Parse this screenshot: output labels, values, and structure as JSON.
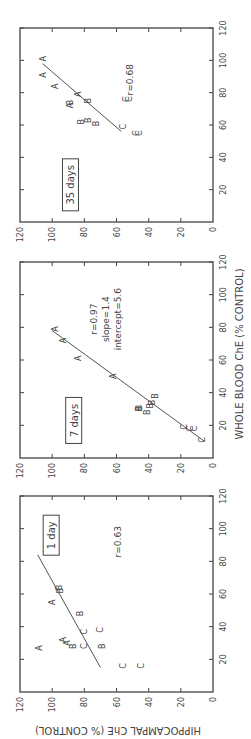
{
  "figure": {
    "ylabel": "HIPPOCAMPAL ChE (% CONTROL)",
    "xlabel": "WHOLE BLOOD ChE (% CONTROL)",
    "rotation_deg": -90
  },
  "chart_data": [
    {
      "type": "scatter",
      "title": "1 day",
      "xlabel": "WHOLE BLOOD ChE (% CONTROL)",
      "ylabel": "HIPPOCAMPAL ChE (% CONTROL)",
      "xlim": [
        0,
        120
      ],
      "ylim": [
        0,
        120
      ],
      "xticks": [
        20,
        40,
        60,
        80,
        100,
        120
      ],
      "yticks": [
        0,
        20,
        40,
        60,
        80,
        100,
        120
      ],
      "annotations": [
        "r=0.63"
      ],
      "points": [
        {
          "label": "A",
          "x": 27,
          "y": 108
        },
        {
          "label": "A",
          "x": 30,
          "y": 91
        },
        {
          "label": "A",
          "x": 32,
          "y": 93
        },
        {
          "label": "B",
          "x": 28,
          "y": 87
        },
        {
          "label": "C",
          "x": 28,
          "y": 80
        },
        {
          "label": "C",
          "x": 37,
          "y": 80
        },
        {
          "label": "B",
          "x": 28,
          "y": 69
        },
        {
          "label": "C",
          "x": 38,
          "y": 70
        },
        {
          "label": "B",
          "x": 48,
          "y": 83
        },
        {
          "label": "A",
          "x": 55,
          "y": 100
        },
        {
          "label": "B",
          "x": 62,
          "y": 95
        },
        {
          "label": "B",
          "x": 64,
          "y": 96
        },
        {
          "label": "A",
          "x": 86,
          "y": 103
        },
        {
          "label": "C",
          "x": 16,
          "y": 56
        },
        {
          "label": "C",
          "x": 16,
          "y": 45
        }
      ],
      "fit_line": {
        "x": [
          15,
          84
        ],
        "y": [
          70,
          109
        ]
      }
    },
    {
      "type": "scatter",
      "title": "7 days",
      "xlabel": "WHOLE BLOOD ChE (% CONTROL)",
      "ylabel": "HIPPOCAMPAL ChE (% CONTROL)",
      "xlim": [
        0,
        120
      ],
      "ylim": [
        0,
        120
      ],
      "xticks": [
        20,
        40,
        60,
        80,
        100,
        120
      ],
      "yticks": [
        0,
        20,
        40,
        60,
        80,
        100,
        120
      ],
      "annotations": [
        "r=0.97",
        "slope=1.4",
        "intercept=5.6"
      ],
      "points": [
        {
          "label": "A",
          "x": 79,
          "y": 98
        },
        {
          "label": "A",
          "x": 72,
          "y": 93
        },
        {
          "label": "A",
          "x": 61,
          "y": 84
        },
        {
          "label": "A",
          "x": 50,
          "y": 62
        },
        {
          "label": "B",
          "x": 30,
          "y": 46
        },
        {
          "label": "B",
          "x": 31,
          "y": 46
        },
        {
          "label": "B",
          "x": 28,
          "y": 41
        },
        {
          "label": "B",
          "x": 32,
          "y": 39
        },
        {
          "label": "B",
          "x": 34,
          "y": 38
        },
        {
          "label": "B",
          "x": 38,
          "y": 36
        },
        {
          "label": "C",
          "x": 19,
          "y": 18
        },
        {
          "label": "C",
          "x": 18,
          "y": 14
        },
        {
          "label": "C",
          "x": 18,
          "y": 12
        },
        {
          "label": "C",
          "x": 11,
          "y": 7
        }
      ],
      "fit_line": {
        "x": [
          10,
          78
        ],
        "y": [
          5,
          100
        ]
      }
    },
    {
      "type": "scatter",
      "title": "35 days",
      "xlabel": "WHOLE BLOOD ChE (% CONTROL)",
      "ylabel": "HIPPOCAMPAL ChE (% CONTROL)",
      "xlim": [
        0,
        120
      ],
      "ylim": [
        0,
        120
      ],
      "xticks": [
        20,
        40,
        60,
        80,
        100,
        120
      ],
      "yticks": [
        0,
        20,
        40,
        60,
        80,
        100,
        120
      ],
      "annotations": [
        "r=0.68"
      ],
      "points": [
        {
          "label": "A",
          "x": 101,
          "y": 106
        },
        {
          "label": "A",
          "x": 91,
          "y": 106
        },
        {
          "label": "A",
          "x": 84,
          "y": 98
        },
        {
          "label": "A",
          "x": 79,
          "y": 84
        },
        {
          "label": "A",
          "x": 72,
          "y": 89
        },
        {
          "label": "B",
          "x": 74,
          "y": 89
        },
        {
          "label": "B",
          "x": 75,
          "y": 78
        },
        {
          "label": "B",
          "x": 62,
          "y": 82
        },
        {
          "label": "B",
          "x": 63,
          "y": 78
        },
        {
          "label": "B",
          "x": 61,
          "y": 73
        },
        {
          "label": "C",
          "x": 76,
          "y": 54
        },
        {
          "label": "C",
          "x": 76,
          "y": 52
        },
        {
          "label": "C",
          "x": 59,
          "y": 56
        },
        {
          "label": "C",
          "x": 55,
          "y": 48
        },
        {
          "label": "C",
          "x": 55,
          "y": 46
        }
      ],
      "fit_line": {
        "x": [
          56,
          98
        ],
        "y": [
          57,
          106
        ]
      }
    }
  ]
}
